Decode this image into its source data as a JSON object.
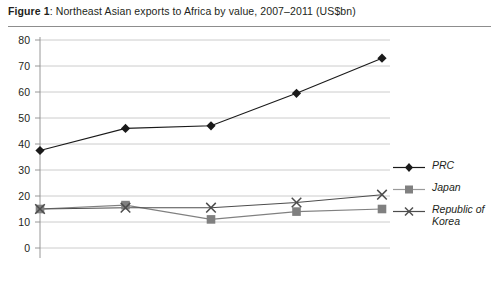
{
  "caption": {
    "label": "Figure 1",
    "separator": ":",
    "text": "Northeast Asian exports to Africa by value, 2007–2011 (US$bn)"
  },
  "chart_data": {
    "type": "line",
    "title": "Northeast Asian exports to Africa by value, 2007–2011 (US$bn)",
    "xlabel": "",
    "ylabel": "",
    "categories": [
      "2007",
      "2008",
      "2009",
      "2010",
      "2011"
    ],
    "x": [
      2007,
      2008,
      2009,
      2010,
      2011
    ],
    "ylim": [
      0,
      80
    ],
    "ytick_step": 10,
    "yticks": [
      "0",
      "10",
      "20",
      "30",
      "40",
      "50",
      "60",
      "70",
      "80"
    ],
    "grid": "horizontal",
    "legend_position": "right",
    "series": [
      {
        "name": "PRC",
        "marker": "diamond",
        "color": "#1a1a1a",
        "values": [
          37.5,
          46,
          47,
          59.5,
          73
        ]
      },
      {
        "name": "Japan",
        "marker": "square",
        "color": "#808080",
        "values": [
          15,
          16.5,
          11,
          14,
          15
        ]
      },
      {
        "name": "Republic of Korea",
        "marker": "x",
        "color": "#4d4d4d",
        "values": [
          15,
          15.5,
          15.5,
          17.5,
          20.5
        ]
      }
    ]
  },
  "legend": {
    "items": [
      {
        "label": "PRC",
        "marker": "diamond-marker",
        "color": "#1a1a1a"
      },
      {
        "label": "Japan",
        "marker": "square-marker",
        "color": "#808080"
      },
      {
        "label": "Republic of Korea",
        "marker": "x-marker",
        "color": "#4d4d4d"
      }
    ]
  }
}
